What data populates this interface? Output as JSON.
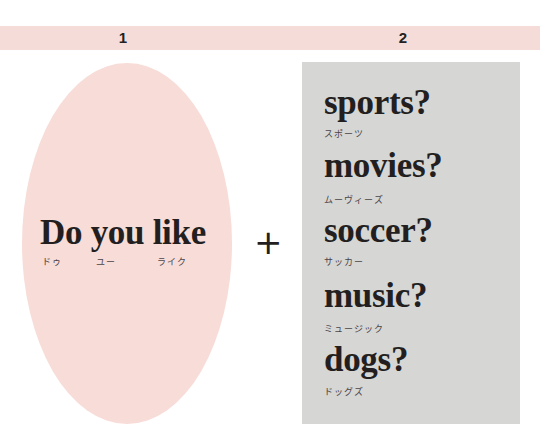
{
  "header": {
    "col1_label": "1",
    "col2_label": "2",
    "band_color": "#f6dcd9"
  },
  "left": {
    "shape_color": "#f7dcd8",
    "phrase": "Do you like",
    "kana": [
      "ドゥ",
      "ユー",
      "ライク"
    ]
  },
  "operator": "+",
  "right": {
    "panel_color": "#d6d6d5",
    "items": [
      {
        "word": "sports?",
        "kana": "スポーツ"
      },
      {
        "word": "movies?",
        "kana": "ムーヴィーズ"
      },
      {
        "word": "soccer?",
        "kana": "サッカー"
      },
      {
        "word": "music?",
        "kana": "ミュージック"
      },
      {
        "word": "dogs?",
        "kana": "ドッグズ"
      }
    ]
  }
}
